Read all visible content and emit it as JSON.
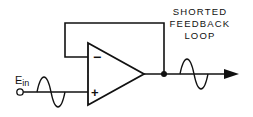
{
  "diagram": {
    "title_lines": [
      "SHORTED",
      "FEEDBACK",
      "LOOP"
    ],
    "input_label_main": "E",
    "input_label_sub": "in",
    "plus_sign": "+",
    "minus_sign": "−",
    "colors": {
      "stroke": "#111111",
      "background": "#ffffff"
    }
  }
}
